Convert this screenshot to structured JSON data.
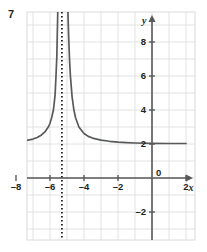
{
  "problem": {
    "number": "7"
  },
  "chart_data": {
    "type": "line",
    "title": "",
    "xlabel": "x",
    "ylabel": "y",
    "xlim": [
      -13.5,
      3.2
    ],
    "ylim": [
      -3.2,
      9.5
    ],
    "grid": true,
    "grid_step": 1,
    "legend": "none",
    "x_ticks": [
      -12,
      -10,
      -8,
      -6,
      -4,
      -2,
      0,
      2
    ],
    "x_tick_labels": [
      "–12",
      "–10",
      "–8",
      "–6",
      "–4",
      "–2",
      "0",
      "2"
    ],
    "y_ticks": [
      -2,
      2,
      4,
      6,
      8
    ],
    "y_tick_labels": [
      "–2",
      "2",
      "4",
      "6",
      "8"
    ],
    "origin_label": "0",
    "asymptotes": [
      {
        "type": "vertical",
        "value": -5.3,
        "style": "dotted",
        "color": "#231f20"
      },
      {
        "type": "horizontal",
        "value": 2,
        "style": "solid-curve-approach"
      }
    ],
    "series": [
      {
        "name": "curve",
        "equation": "y = 1/(x + 5.3)^2 + 2",
        "color": "#58595b",
        "points": [
          [
            -13.5,
            2.03
          ],
          [
            -13.0,
            2.03
          ],
          [
            -12.0,
            2.04
          ],
          [
            -11.0,
            2.05
          ],
          [
            -10.0,
            2.05
          ],
          [
            -9.5,
            2.06
          ],
          [
            -9.0,
            2.07
          ],
          [
            -8.5,
            2.1
          ],
          [
            -8.0,
            2.13
          ],
          [
            -7.5,
            2.19
          ],
          [
            -7.0,
            2.29
          ],
          [
            -6.75,
            2.38
          ],
          [
            -6.5,
            2.53
          ],
          [
            -6.3,
            2.71
          ],
          [
            -6.1,
            3.0
          ],
          [
            -6.0,
            3.22
          ],
          [
            -5.9,
            3.56
          ],
          [
            -5.8,
            4.0
          ],
          [
            -5.75,
            4.42
          ],
          [
            -5.7,
            4.9
          ],
          [
            -5.65,
            5.94
          ],
          [
            -5.6,
            7.1
          ],
          [
            -5.55,
            9.44
          ],
          [
            -5.52,
            11.4
          ],
          [
            -5.5,
            17.6
          ],
          [
            -5.45,
            27.6
          ],
          [
            -5.4,
            100.0
          ],
          [
            -5.2,
            100.0
          ],
          [
            -5.15,
            46.4
          ],
          [
            -5.1,
            27.0
          ],
          [
            -5.05,
            18.0
          ],
          [
            -5.0,
            13.1
          ],
          [
            -4.95,
            9.9
          ],
          [
            -4.9,
            8.25
          ],
          [
            -4.85,
            6.94
          ],
          [
            -4.8,
            6.0
          ],
          [
            -4.7,
            4.78
          ],
          [
            -4.6,
            4.04
          ],
          [
            -4.5,
            3.56
          ],
          [
            -4.3,
            3.0
          ],
          [
            -4.0,
            2.62
          ],
          [
            -3.75,
            2.45
          ],
          [
            -3.5,
            2.35
          ],
          [
            -3.0,
            2.23
          ],
          [
            -2.5,
            2.16
          ],
          [
            -2.0,
            2.11
          ],
          [
            -1.5,
            2.08
          ],
          [
            -1.0,
            2.06
          ],
          [
            0.0,
            2.04
          ],
          [
            1.0,
            2.03
          ],
          [
            2.0,
            2.03
          ],
          [
            3.2,
            2.02
          ]
        ]
      }
    ]
  },
  "axes": {
    "y_arrow": "up-arrow",
    "x_arrow": "right-arrow"
  }
}
